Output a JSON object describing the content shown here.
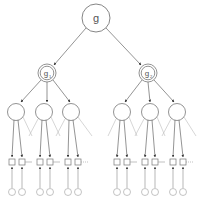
{
  "diagram": {
    "type": "tree",
    "root": {
      "label": "g",
      "sub": ""
    },
    "children": [
      {
        "label": "g",
        "sub": "1"
      },
      {
        "label": "g",
        "sub": "2"
      }
    ],
    "colors": {
      "stroke": "#555555",
      "light": "#9a9a9a",
      "background": "#ffffff"
    },
    "levels": [
      "root node",
      "double-circle subgoal nodes",
      "state circles",
      "square nodes",
      "small input circles"
    ]
  }
}
